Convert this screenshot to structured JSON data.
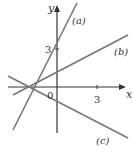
{
  "axes": {
    "x_label": "x",
    "y_label": "y",
    "origin_label": "0",
    "x_tick_label": "3",
    "y_tick_label": "3"
  },
  "lines": [
    {
      "label": "(a)",
      "equation": "y = 2x + 3",
      "x1": 13,
      "y1": 130,
      "x2": 77,
      "y2": 3
    },
    {
      "label": "(b)",
      "equation": "y = 0.5x + 1",
      "x1": 13,
      "y1": 95,
      "x2": 128,
      "y2": 35
    },
    {
      "label": "(c)",
      "equation": "y = -0.5x - 1",
      "x1": 8,
      "y1": 76,
      "x2": 128,
      "y2": 138
    }
  ],
  "colors": {
    "line": "#777777",
    "axis": "#333333"
  }
}
